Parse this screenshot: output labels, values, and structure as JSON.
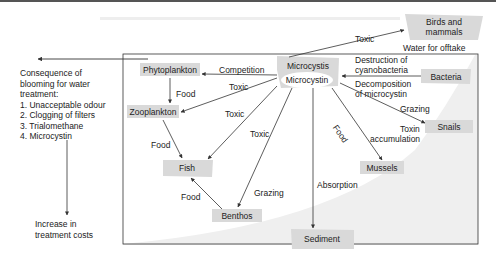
{
  "diagram": {
    "nodes": {
      "birds": "Birds and mammals",
      "birds_line1": "Birds and",
      "birds_line2": "mammals",
      "water_offtake": "Water for offtake",
      "microcystis": "Microcystis",
      "microcystin": "Microcystin",
      "phytoplankton": "Phytoplankton",
      "zooplankton": "Zooplankton",
      "fish": "Fish",
      "benthos": "Benthos",
      "sediment": "Sediment",
      "mussels": "Mussels",
      "snails": "Snails",
      "bacteria": "Bacteria"
    },
    "edges": {
      "toxic_birds": "Toxic",
      "competition": "Competition",
      "food_phyto_zoo": "Food",
      "toxic_zoo": "Toxic",
      "toxic_fish_1": "Toxic",
      "toxic_fish_2": "Toxic",
      "food_zoo_fish": "Food",
      "food_benthos_fish": "Food",
      "grazing_benthos": "Grazing",
      "absorption": "Absorption",
      "food_mussels": "Food",
      "grazing_snails": "Grazing",
      "toxin_accumulation_1": "Toxin",
      "toxin_accumulation_2": "accumulation",
      "destruction_1": "Destruction of",
      "destruction_2": "cyanobacteria",
      "decomposition_1": "Decomposition",
      "decomposition_2": "of microcystin"
    },
    "consequences": {
      "title_1": "Consequence of",
      "title_2": "blooming for water",
      "title_3": "treatment:",
      "items": [
        "1. Unacceptable odour",
        "2. Clogging of filters",
        "3. Trialomethane",
        "4. Microcystin"
      ],
      "result_1": "Increase in",
      "result_2": "treatment costs"
    },
    "colors": {
      "node_fill": "#d9d9d9",
      "background_wedge": "#efefef",
      "line": "#333333"
    }
  }
}
